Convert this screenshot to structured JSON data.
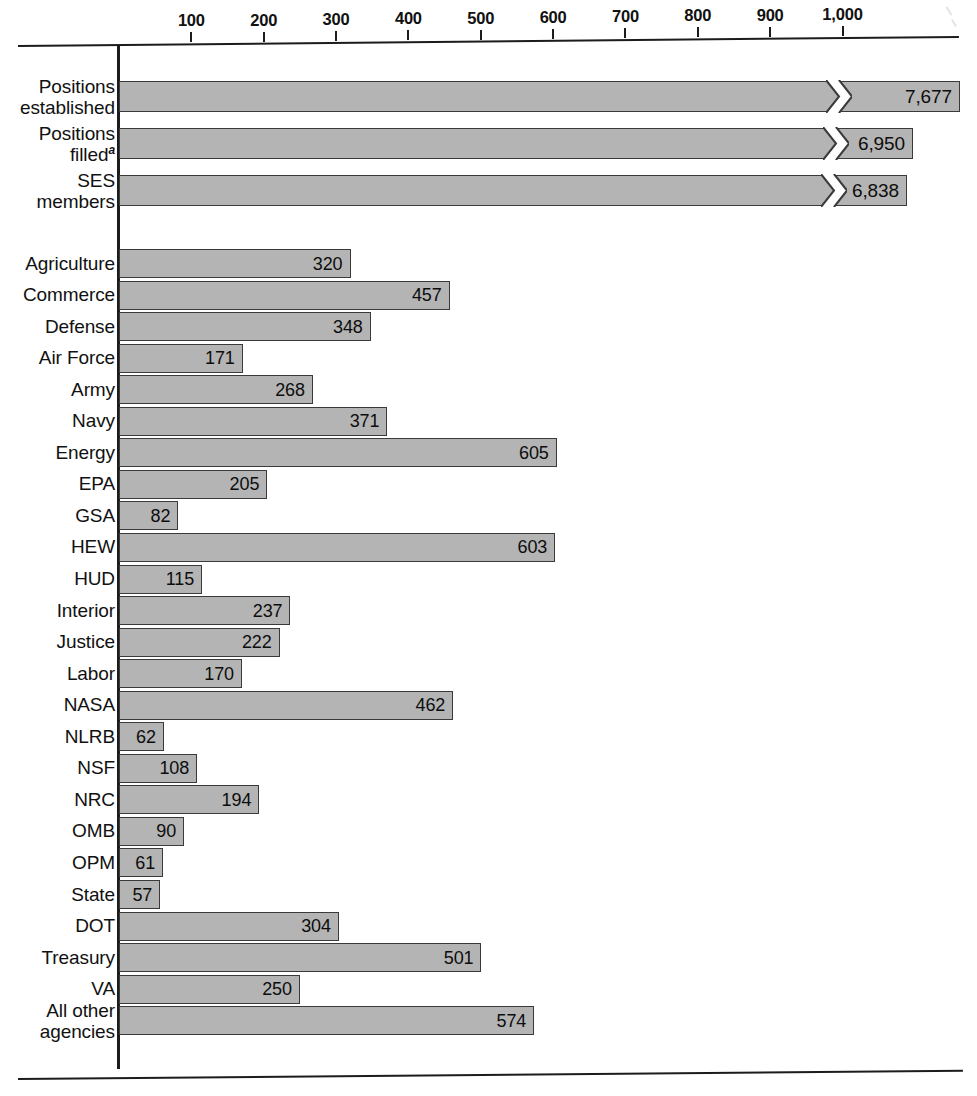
{
  "chart_data": {
    "type": "bar",
    "orientation": "horizontal",
    "title": "",
    "xlabel": "",
    "ylabel": "",
    "xlim": [
      0,
      1050
    ],
    "grid": false,
    "legend": null,
    "axis_ticks": [
      100,
      200,
      300,
      400,
      500,
      600,
      700,
      800,
      900,
      1000
    ],
    "axis_tick_labels": [
      "100",
      "200",
      "300",
      "400",
      "500",
      "600",
      "700",
      "800",
      "900",
      "1,000"
    ],
    "note": "Top three bars are broken (scale break) because their values exceed the axis range.",
    "groups": [
      {
        "name": "summary",
        "broken_axis": true,
        "categories": [
          "Positions established",
          "Positions filled",
          "SES members"
        ],
        "values": [
          7677,
          6950,
          6838
        ],
        "value_labels": [
          "7,677",
          "6,950",
          "6,838"
        ]
      },
      {
        "name": "agencies",
        "broken_axis": false,
        "categories": [
          "Agriculture",
          "Commerce",
          "Defense",
          "Air Force",
          "Army",
          "Navy",
          "Energy",
          "EPA",
          "GSA",
          "HEW",
          "HUD",
          "Interior",
          "Justice",
          "Labor",
          "NASA",
          "NLRB",
          "NSF",
          "NRC",
          "OMB",
          "OPM",
          "State",
          "DOT",
          "Treasury",
          "VA",
          "All other agencies"
        ],
        "values": [
          320,
          457,
          348,
          171,
          268,
          371,
          605,
          205,
          82,
          603,
          115,
          237,
          222,
          170,
          462,
          62,
          108,
          194,
          90,
          61,
          57,
          304,
          501,
          250,
          574
        ],
        "value_labels": [
          "320",
          "457",
          "348",
          "171",
          "268",
          "371",
          "605",
          "205",
          "82",
          "603",
          "115",
          "237",
          "222",
          "170",
          "462",
          "62",
          "108",
          "194",
          "90",
          "61",
          "57",
          "304",
          "501",
          "250",
          "574"
        ]
      }
    ]
  },
  "summary_rows": [
    {
      "label_line1": "Positions",
      "label_line2": "established",
      "footnote": "",
      "value_label": "7,677"
    },
    {
      "label_line1": "Positions",
      "label_line2": "filled",
      "footnote": "a",
      "value_label": "6,950"
    },
    {
      "label_line1": "SES",
      "label_line2": "members",
      "footnote": "",
      "value_label": "6,838"
    }
  ],
  "agency_rows": [
    {
      "label": "Agriculture",
      "value_label": "320"
    },
    {
      "label": "Commerce",
      "value_label": "457"
    },
    {
      "label": "Defense",
      "value_label": "348"
    },
    {
      "label": "Air Force",
      "value_label": "171"
    },
    {
      "label": "Army",
      "value_label": "268"
    },
    {
      "label": "Navy",
      "value_label": "371"
    },
    {
      "label": "Energy",
      "value_label": "605"
    },
    {
      "label": "EPA",
      "value_label": "205"
    },
    {
      "label": "GSA",
      "value_label": "82"
    },
    {
      "label": "HEW",
      "value_label": "603"
    },
    {
      "label": "HUD",
      "value_label": "115"
    },
    {
      "label": "Interior",
      "value_label": "237"
    },
    {
      "label": "Justice",
      "value_label": "222"
    },
    {
      "label": "Labor",
      "value_label": "170"
    },
    {
      "label": "NASA",
      "value_label": "462"
    },
    {
      "label": "NLRB",
      "value_label": "62"
    },
    {
      "label": "NSF",
      "value_label": "108"
    },
    {
      "label": "NRC",
      "value_label": "194"
    },
    {
      "label": "OMB",
      "value_label": "90"
    },
    {
      "label": "OPM",
      "value_label": "61"
    },
    {
      "label": "State",
      "value_label": "57"
    },
    {
      "label": "DOT",
      "value_label": "304"
    },
    {
      "label": "Treasury",
      "value_label": "501"
    },
    {
      "label": "VA",
      "value_label": "250"
    },
    {
      "label": "All other agencies",
      "value_label": "574"
    }
  ],
  "axis": {
    "tick_labels": [
      "100",
      "200",
      "300",
      "400",
      "500",
      "600",
      "700",
      "800",
      "900",
      "1,000"
    ]
  },
  "colors": {
    "bar_fill": "#b4b4b4",
    "bar_border": "#3a3a3a",
    "axis": "#1c1c1c",
    "text": "#111111",
    "background": "#ffffff"
  }
}
